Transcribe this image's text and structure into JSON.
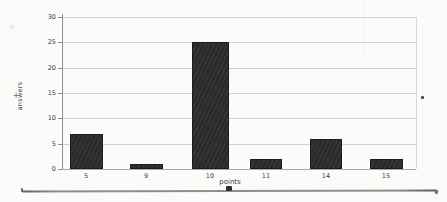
{
  "chart_data": {
    "type": "bar",
    "categories": [
      "5",
      "9",
      "10",
      "11",
      "14",
      "15"
    ],
    "values": [
      7,
      1,
      25,
      2,
      6,
      2
    ],
    "title": "",
    "xlabel": "points",
    "ylabel": "answers",
    "ylim": [
      0,
      30
    ],
    "yticks": [
      0,
      5,
      10,
      15,
      20,
      25,
      30
    ],
    "grid": true,
    "legend": false,
    "bar_color": "#2b2b2b",
    "gridline_color": "#d2d2cf",
    "axis_color": "#8f8f8c",
    "label_color": "#3c3c3a",
    "background_color": "#fbfbf9"
  },
  "margin_marks": {
    "left_glyph": "+"
  }
}
